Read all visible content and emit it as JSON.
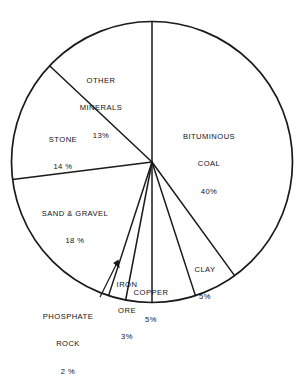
{
  "chart_data": {
    "type": "pie",
    "title": "",
    "subtitle": "",
    "xlabel": "",
    "ylabel": "",
    "legend": "none",
    "grid": false,
    "units": "percent",
    "start_angle_deg": 0,
    "direction": "clockwise",
    "categories": [
      "BITUMINOUS COAL",
      "CLAY",
      "COPPER",
      "IRON ORE",
      "PHOSPHATE ROCK",
      "SAND & GRAVEL",
      "STONE",
      "OTHER MINERALS"
    ],
    "values": [
      40,
      5,
      5,
      3,
      2,
      18,
      14,
      13
    ],
    "slices": [
      {
        "key": "bituminous-coal",
        "name_line1": "BITUMINOUS",
        "name_line2": "COAL",
        "value": 40,
        "value_label": "40%",
        "color": "#ffffff"
      },
      {
        "key": "clay",
        "name_line1": "CLAY",
        "name_line2": "",
        "value": 5,
        "value_label": "5%",
        "color": "#ffffff"
      },
      {
        "key": "copper",
        "name_line1": "COPPER",
        "name_line2": "",
        "value": 5,
        "value_label": "5%",
        "color": "#ffffff"
      },
      {
        "key": "iron-ore",
        "name_line1": "IRON",
        "name_line2": "ORE",
        "value": 3,
        "value_label": "3%",
        "color": "#ffffff"
      },
      {
        "key": "phosphate-rock",
        "name_line1": "PHOSPHATE",
        "name_line2": "ROCK",
        "value": 2,
        "value_label": "2 %",
        "color": "#ffffff"
      },
      {
        "key": "sand-gravel",
        "name_line1": "SAND & GRAVEL",
        "name_line2": "",
        "value": 18,
        "value_label": "18 %",
        "color": "#ffffff"
      },
      {
        "key": "stone",
        "name_line1": "STONE",
        "name_line2": "",
        "value": 14,
        "value_label": "14 %",
        "color": "#ffffff"
      },
      {
        "key": "other-minerals",
        "name_line1": "OTHER",
        "name_line2": "MINERALS",
        "value": 13,
        "value_label": "13%",
        "color": "#ffffff"
      }
    ]
  },
  "style": {
    "stroke_color": "#1a1a1a",
    "background": "#ffffff",
    "slice_fill": "#ffffff"
  },
  "annotations": {
    "phosphate_leader": "arrow pointing from PHOSPHATE ROCK label to its thin slice"
  }
}
